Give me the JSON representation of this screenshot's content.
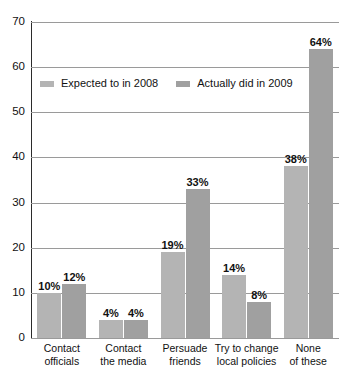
{
  "chart_data": {
    "type": "bar",
    "title": "",
    "xlabel": "",
    "ylabel": "",
    "ylim": [
      0,
      70
    ],
    "yticks": [
      0,
      10,
      20,
      30,
      40,
      50,
      60,
      70
    ],
    "grid": true,
    "legend_position": "top-left-inside",
    "categories": [
      "Contact officials",
      "Contact the media",
      "Persuade friends",
      "Try to change local policies",
      "None of these"
    ],
    "category_lines": [
      [
        "Contact",
        "officials"
      ],
      [
        "Contact",
        "the media"
      ],
      [
        "Persuade",
        "friends"
      ],
      [
        "Try to change",
        "local policies"
      ],
      [
        "None",
        "of these"
      ]
    ],
    "series": [
      {
        "name": "Expected to in 2008",
        "color": "#b4b4b4",
        "values": [
          10,
          4,
          19,
          14,
          38
        ],
        "labels": [
          "10%",
          "4%",
          "19%",
          "14%",
          "38%"
        ]
      },
      {
        "name": "Actually did in 2009",
        "color": "#a0a0a0",
        "values": [
          12,
          4,
          33,
          8,
          64
        ],
        "labels": [
          "12%",
          "4%",
          "33%",
          "8%",
          "64%"
        ]
      }
    ]
  }
}
